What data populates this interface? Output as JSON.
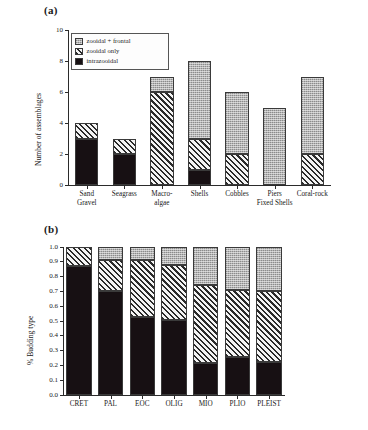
{
  "figure": {
    "caption_fragment": "",
    "panel_a_label": "(a)",
    "panel_b_label": "(b)"
  },
  "chart_data": [
    {
      "id": "panel-a",
      "type": "bar",
      "stacked": true,
      "title": "(a)",
      "xlabel": "",
      "ylabel": "Number of assemblages",
      "ylim": [
        0,
        10
      ],
      "yticks": [
        "0",
        "2",
        "4",
        "6",
        "8",
        "10"
      ],
      "ytick_values": [
        0,
        2,
        4,
        6,
        8,
        10
      ],
      "grid": false,
      "legend_position": "upper-left-inside",
      "categories": [
        "Sand\nGravel",
        "Seagrass",
        "Macro-\nalgae",
        "Shells",
        "Cobbles",
        "Piers\nFixed Shells",
        "Coral-rock"
      ],
      "category_lines": [
        [
          "Sand",
          "Gravel"
        ],
        [
          "Seagrass",
          ""
        ],
        [
          "Macro-",
          "algae"
        ],
        [
          "Shells",
          ""
        ],
        [
          "Cobbles",
          ""
        ],
        [
          "Piers",
          "Fixed Shells"
        ],
        [
          "Coral-rock",
          ""
        ]
      ],
      "series": [
        {
          "name": "intrazooidal",
          "fill": "solid-black",
          "color": "#171013",
          "values": [
            3,
            2,
            0,
            1,
            0,
            0,
            0
          ]
        },
        {
          "name": "zooidal only",
          "fill": "hatched",
          "color": "#f2f2f2",
          "values": [
            1,
            1,
            6,
            2,
            2,
            0,
            2
          ]
        },
        {
          "name": "zooidal + frontal",
          "fill": "stippled-grey",
          "color": "#b4b4b4",
          "values": [
            0,
            0,
            1,
            5,
            4,
            5,
            5
          ]
        }
      ],
      "totals": [
        4,
        3,
        7,
        8,
        6,
        5,
        7
      ],
      "legend": [
        {
          "label": "zooidal + frontal",
          "fill": "stippled-grey"
        },
        {
          "label": "zooidal only",
          "fill": "hatched"
        },
        {
          "label": "intrazooidal",
          "fill": "solid-black"
        }
      ]
    },
    {
      "id": "panel-b",
      "type": "bar",
      "stacked": true,
      "title": "(b)",
      "xlabel": "",
      "ylabel": "% Budding type",
      "ylim": [
        0.0,
        1.0
      ],
      "yticks": [
        "0.0",
        "0.1",
        "0.2",
        "0.3",
        "0.4",
        "0.5",
        "0.6",
        "0.7",
        "0.8",
        "0.9",
        "1.0"
      ],
      "ytick_values": [
        0.0,
        0.1,
        0.2,
        0.3,
        0.4,
        0.5,
        0.6,
        0.7,
        0.8,
        0.9,
        1.0
      ],
      "grid": false,
      "legend_position": "right-outside",
      "categories": [
        "CRET",
        "PAL",
        "EOC",
        "OLIG",
        "MIO",
        "PLIO",
        "PLEIST"
      ],
      "series": [
        {
          "name": "%intrazooidal",
          "fill": "solid-black",
          "color": "#171013",
          "values": [
            0.87,
            0.7,
            0.53,
            0.51,
            0.215,
            0.26,
            0.22
          ]
        },
        {
          "name": "%zooidal",
          "fill": "hatched",
          "color": "#f2f2f2",
          "values": [
            0.13,
            0.21,
            0.38,
            0.37,
            0.525,
            0.45,
            0.48
          ]
        },
        {
          "name": "%frontal",
          "fill": "stippled-grey",
          "color": "#b4b4b4",
          "values": [
            0.0,
            0.09,
            0.09,
            0.12,
            0.26,
            0.29,
            0.3
          ]
        }
      ],
      "legend": [
        {
          "label": "%frontal",
          "fill": "stippled-grey"
        },
        {
          "label": "%zooidal",
          "fill": "hatched"
        },
        {
          "label": "%intrazooidal",
          "fill": "solid-black"
        }
      ]
    }
  ]
}
